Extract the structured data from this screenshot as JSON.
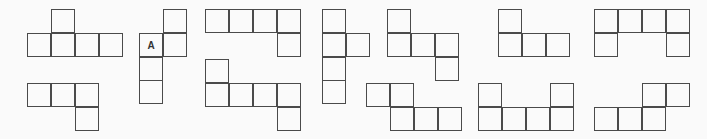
{
  "figure": {
    "cell_size": 24,
    "line_color": "#4a4a4a",
    "background": "#fafafa",
    "nets": [
      {
        "id": "net-1",
        "cells": [
          [
            51,
            9
          ],
          [
            27,
            33
          ],
          [
            51,
            33
          ],
          [
            75,
            33
          ],
          [
            99,
            33
          ]
        ]
      },
      {
        "id": "net-2",
        "cells": [
          [
            27,
            83
          ],
          [
            51,
            83
          ],
          [
            75,
            83
          ],
          [
            75,
            107
          ]
        ]
      },
      {
        "id": "net-3",
        "cells": [
          [
            163,
            9
          ],
          [
            139,
            33,
            "A"
          ],
          [
            163,
            33
          ],
          [
            139,
            57
          ],
          [
            139,
            80
          ]
        ]
      },
      {
        "id": "net-4",
        "cells": [
          [
            205,
            9
          ],
          [
            229,
            9
          ],
          [
            253,
            9
          ],
          [
            277,
            9
          ],
          [
            277,
            33
          ]
        ]
      },
      {
        "id": "net-5",
        "cells": [
          [
            205,
            59
          ],
          [
            205,
            83
          ],
          [
            229,
            83
          ],
          [
            253,
            83
          ],
          [
            277,
            83
          ],
          [
            277,
            107
          ]
        ]
      },
      {
        "id": "net-6",
        "cells": [
          [
            322,
            9
          ],
          [
            322,
            33
          ],
          [
            346,
            33
          ],
          [
            322,
            57
          ],
          [
            322,
            80
          ]
        ]
      },
      {
        "id": "net-7",
        "cells": [
          [
            387,
            9
          ],
          [
            387,
            33
          ],
          [
            411,
            33
          ],
          [
            435,
            33
          ],
          [
            435,
            57
          ]
        ]
      },
      {
        "id": "net-8",
        "cells": [
          [
            366,
            83
          ],
          [
            390,
            83
          ],
          [
            390,
            107
          ],
          [
            414,
            107
          ],
          [
            438,
            107
          ]
        ]
      },
      {
        "id": "net-9",
        "cells": [
          [
            498,
            9
          ],
          [
            498,
            33
          ],
          [
            522,
            33
          ],
          [
            546,
            33
          ]
        ]
      },
      {
        "id": "net-10",
        "cells": [
          [
            478,
            83
          ],
          [
            550,
            83
          ],
          [
            478,
            107
          ],
          [
            502,
            107
          ],
          [
            526,
            107
          ],
          [
            550,
            107
          ]
        ]
      },
      {
        "id": "net-11",
        "cells": [
          [
            594,
            9
          ],
          [
            618,
            9
          ],
          [
            642,
            9
          ],
          [
            666,
            9
          ],
          [
            594,
            33
          ],
          [
            666,
            33
          ]
        ]
      },
      {
        "id": "net-12",
        "cells": [
          [
            642,
            83
          ],
          [
            666,
            83
          ],
          [
            594,
            107
          ],
          [
            618,
            107
          ],
          [
            642,
            107
          ]
        ]
      }
    ]
  }
}
